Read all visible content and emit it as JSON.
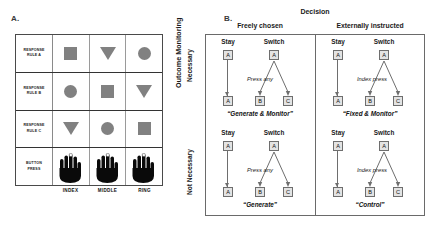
{
  "panels": {
    "a_letter": "A.",
    "b_letter": "B."
  },
  "panel_a": {
    "row_labels": [
      {
        "line1": "RESPONSE",
        "line2": "RULE A"
      },
      {
        "line1": "RESPONSE",
        "line2": "RULE B"
      },
      {
        "line1": "RESPONSE",
        "line2": "RULE C"
      },
      {
        "line1": "BUTTON",
        "line2": "PRESS"
      }
    ],
    "column_labels": [
      "INDEX",
      "MIDDLE",
      "RING"
    ],
    "shape_grid": [
      [
        "square",
        "triangle",
        "circle"
      ],
      [
        "circle",
        "square",
        "triangle"
      ],
      [
        "triangle",
        "circle",
        "square"
      ]
    ],
    "hand_icons": [
      "hand-index-press-icon",
      "hand-middle-press-icon",
      "hand-ring-press-icon"
    ],
    "shape_color": "#818181"
  },
  "panel_b": {
    "y_axis_title": "Outcome Monitoring",
    "y_axis_levels": [
      "Necessary",
      "Not Necessary"
    ],
    "x_axis_title": "Decision",
    "x_axis_levels": [
      "Freely chosen",
      "Externally instructed"
    ],
    "quadrants": [
      {
        "id": "freely-chosen-necessary",
        "stay_label": "Stay",
        "switch_label": "Switch",
        "stay_top": "A",
        "stay_bottom": "A",
        "switch_top": "A",
        "switch_left": "B",
        "switch_right": "C",
        "note": "Press any",
        "name": "“Generate & Monitor”"
      },
      {
        "id": "externally-instructed-necessary",
        "stay_label": "Stay",
        "switch_label": "Switch",
        "stay_top": "A",
        "stay_bottom": "A",
        "switch_top": "A",
        "switch_left": "B",
        "switch_right": "C",
        "note": "Index press",
        "name": "“Fixed & Monitor”"
      },
      {
        "id": "freely-chosen-not-necessary",
        "stay_label": "Stay",
        "switch_label": "Switch",
        "stay_top": "A",
        "stay_bottom": "A",
        "switch_top": "A",
        "switch_left": "B",
        "switch_right": "C",
        "note": "Press any",
        "name": "“Generate”"
      },
      {
        "id": "externally-instructed-not-necessary",
        "stay_label": "Stay",
        "switch_label": "Switch",
        "stay_top": "A",
        "stay_bottom": "A",
        "switch_top": "A",
        "switch_left": "B",
        "switch_right": "C",
        "note": "Index press",
        "name": "“Control”"
      }
    ]
  }
}
